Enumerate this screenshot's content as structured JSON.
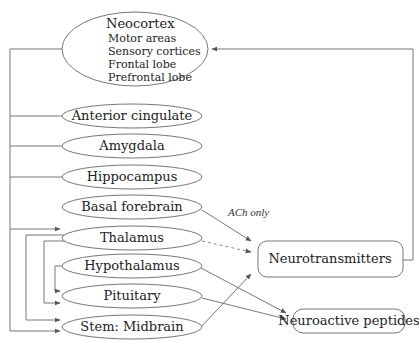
{
  "diagram": {
    "neocortex": {
      "title": "Neocortex",
      "items": [
        "Motor areas",
        "Sensory cortices",
        "Frontal lobe",
        "Prefrontal lobe"
      ]
    },
    "nodes": {
      "anterior_cingulate": "Anterior cingulate",
      "amygdala": "Amygdala",
      "hippocampus": "Hippocampus",
      "basal_forebrain": "Basal forebrain",
      "thalamus": "Thalamus",
      "hypothalamus": "Hypothalamus",
      "pituitary": "Pituitary",
      "stem_midbrain": "Stem: Midbrain"
    },
    "outputs": {
      "neurotransmitters": "Neurotransmitters",
      "neuroactive_peptides": "Neuroactive peptides"
    },
    "annotations": {
      "ach_only": "ACh only"
    },
    "colors": {
      "stroke": "#777777",
      "text": "#222222",
      "background": "#ffffff"
    }
  }
}
